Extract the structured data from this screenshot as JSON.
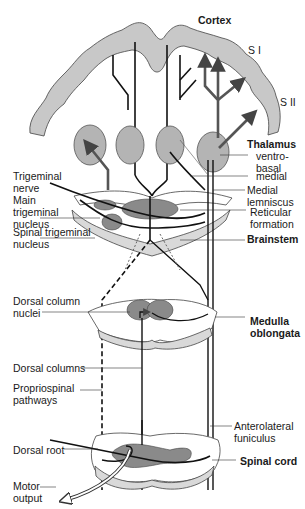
{
  "diagram": {
    "regions": {
      "cortex": "Cortex",
      "s1": "S I",
      "s2": "S II",
      "thalamus": "Thalamus",
      "brainstem": "Brainstem",
      "medulla": [
        "Medulla",
        "oblongata"
      ],
      "spinal_cord": "Spinal cord"
    },
    "labels": {
      "ventrobasal": [
        "ventro-",
        "basal"
      ],
      "medial": "medial",
      "medial_lemniscus": [
        "Medial",
        "lemniscus"
      ],
      "reticular_formation": [
        "Reticular",
        "formation"
      ],
      "trigeminal_nerve": [
        "Trigeminal",
        "nerve"
      ],
      "main_trigeminal_nucleus": [
        "Main",
        "trigeminal",
        "nucleus"
      ],
      "spinal_trigeminal_nucleus": [
        "Spinal trigeminal",
        "nucleus"
      ],
      "dorsal_column_nuclei": [
        "Dorsal column",
        "nuclei"
      ],
      "dorsal_columns": "Dorsal columns",
      "propriospinal_pathways": [
        "Propriospinal",
        "pathways"
      ],
      "anterolateral_funiculus": [
        "Anterolateral",
        "funiculus"
      ],
      "dorsal_root": "Dorsal root",
      "motor_output": [
        "Motor",
        "output"
      ]
    },
    "colors": {
      "cortex_fill": "#c8c8c8",
      "nucleus_fill": "#8a8a8a",
      "thalamus_fill": "#b4b4b4",
      "pathway_dark": "#111111",
      "pathway_gray": "#555555",
      "tissue_fill": "#d9d9d9"
    }
  }
}
